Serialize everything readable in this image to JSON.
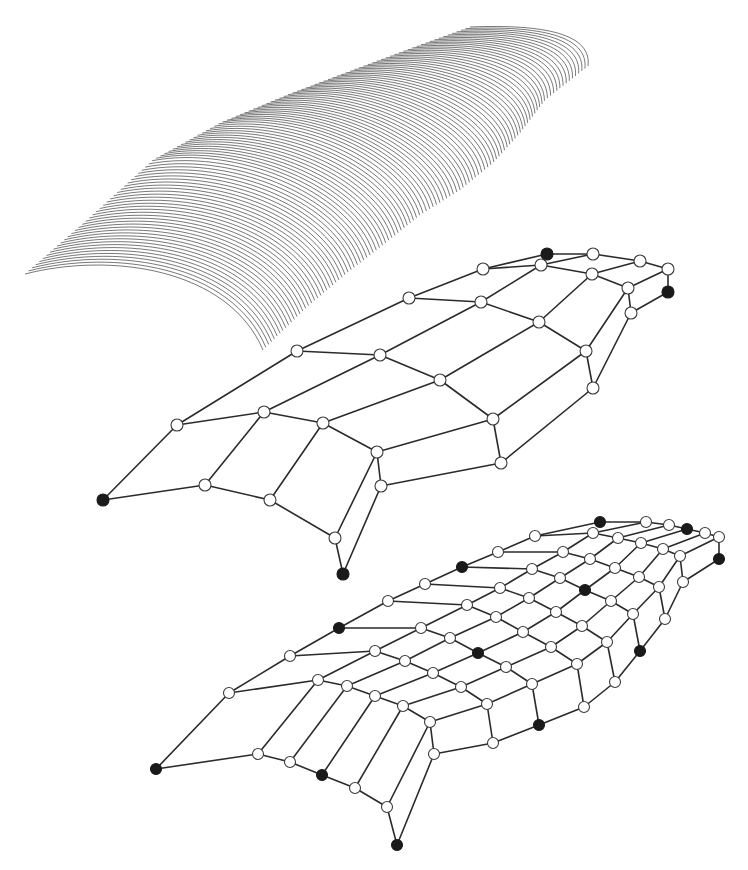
{
  "figure": {
    "width": 748,
    "height": 870,
    "colors": {
      "background": "#ffffff",
      "curve": "#2a2a2a",
      "edge": "#2b2b2b",
      "open_node_fill": "#ffffff",
      "filled_node_fill": "#1a1a1a"
    }
  },
  "ruled_surface": {
    "curve_count": 110,
    "first_curve": [
      [
        25,
        274
      ],
      [
        110,
        252
      ],
      [
        228,
        268
      ],
      [
        263,
        350
      ]
    ],
    "last_curve": [
      [
        470,
        27
      ],
      [
        545,
        24
      ],
      [
        592,
        34
      ],
      [
        588,
        66
      ]
    ],
    "start_edge": [
      [
        25,
        274
      ],
      [
        87,
        220
      ],
      [
        153,
        160
      ],
      [
        220,
        123
      ],
      [
        287,
        95
      ],
      [
        353,
        70
      ],
      [
        420,
        45
      ],
      [
        470,
        27
      ]
    ],
    "end_edge": [
      [
        263,
        350
      ],
      [
        307,
        307
      ],
      [
        347,
        273
      ],
      [
        383,
        245
      ],
      [
        420,
        215
      ],
      [
        460,
        190
      ],
      [
        493,
        163
      ],
      [
        520,
        133
      ],
      [
        545,
        100
      ],
      [
        588,
        66
      ]
    ]
  },
  "coarse_mesh": {
    "rows": 5,
    "cols": 6,
    "node_radius": 6,
    "nodes": [
      [
        [
          103,
          500
        ],
        [
          177,
          425
        ],
        [
          297,
          351
        ],
        [
          409,
          298
        ],
        [
          483,
          269
        ],
        [
          547,
          254
        ]
      ],
      [
        [
          205,
          485
        ],
        [
          264,
          412
        ],
        [
          380,
          355
        ],
        [
          481,
          302
        ],
        [
          541,
          265
        ],
        [
          593,
          254
        ]
      ],
      [
        [
          270,
          500
        ],
        [
          323,
          423
        ],
        [
          440,
          380
        ],
        [
          539,
          322
        ],
        [
          592,
          274
        ],
        [
          640,
          261
        ]
      ],
      [
        [
          335,
          538
        ],
        [
          377,
          452
        ],
        [
          493,
          419
        ],
        [
          586,
          351
        ],
        [
          628,
          288
        ],
        [
          668,
          269
        ]
      ],
      [
        [
          343,
          574
        ],
        [
          381,
          486
        ],
        [
          501,
          463
        ],
        [
          593,
          388
        ],
        [
          631,
          313
        ],
        [
          668,
          292
        ]
      ]
    ],
    "filled": [
      [
        0,
        0
      ],
      [
        0,
        5
      ],
      [
        4,
        0
      ],
      [
        4,
        5
      ]
    ]
  },
  "fine_mesh": {
    "rows": 7,
    "cols": 10,
    "node_radius": 5.5,
    "nodes": [
      [
        [
          156,
          769
        ],
        [
          229,
          693
        ],
        [
          290,
          656
        ],
        [
          339,
          628
        ],
        [
          388,
          601
        ],
        [
          425,
          584
        ],
        [
          462,
          567
        ],
        [
          498,
          552
        ],
        [
          535,
          536
        ],
        [
          600,
          522
        ]
      ],
      [
        [
          258,
          754
        ],
        [
          318,
          680
        ],
        [
          375,
          651
        ],
        [
          421,
          628
        ],
        [
          467,
          605
        ],
        [
          500,
          588
        ],
        [
          532,
          569
        ],
        [
          563,
          552
        ],
        [
          593,
          533
        ],
        [
          646,
          522
        ]
      ],
      [
        [
          290,
          762
        ],
        [
          347,
          686
        ],
        [
          405,
          661
        ],
        [
          450,
          638
        ],
        [
          496,
          617
        ],
        [
          529,
          598
        ],
        [
          560,
          578
        ],
        [
          590,
          559
        ],
        [
          618,
          538
        ],
        [
          669,
          525
        ]
      ],
      [
        [
          322,
          775
        ],
        [
          375,
          696
        ],
        [
          433,
          673
        ],
        [
          478,
          653
        ],
        [
          523,
          632
        ],
        [
          556,
          612
        ],
        [
          585,
          590
        ],
        [
          615,
          568
        ],
        [
          641,
          543
        ],
        [
          687,
          529
        ]
      ],
      [
        [
          355,
          788
        ],
        [
          403,
          706
        ],
        [
          461,
          687
        ],
        [
          506,
          667
        ],
        [
          551,
          647
        ],
        [
          582,
          626
        ],
        [
          611,
          601
        ],
        [
          639,
          577
        ],
        [
          663,
          549
        ],
        [
          705,
          533
        ]
      ],
      [
        [
          387,
          807
        ],
        [
          430,
          722
        ],
        [
          487,
          704
        ],
        [
          532,
          684
        ],
        [
          577,
          664
        ],
        [
          607,
          642
        ],
        [
          633,
          614
        ],
        [
          659,
          587
        ],
        [
          680,
          556
        ],
        [
          719,
          537
        ]
      ],
      [
        [
          397,
          845
        ],
        [
          434,
          754
        ],
        [
          493,
          743
        ],
        [
          539,
          725
        ],
        [
          584,
          707
        ],
        [
          615,
          682
        ],
        [
          640,
          651
        ],
        [
          665,
          619
        ],
        [
          683,
          582
        ],
        [
          719,
          559
        ]
      ]
    ],
    "filled": [
      [
        0,
        0
      ],
      [
        0,
        3
      ],
      [
        0,
        6
      ],
      [
        0,
        9
      ],
      [
        3,
        0
      ],
      [
        3,
        3
      ],
      [
        3,
        6
      ],
      [
        3,
        9
      ],
      [
        6,
        0
      ],
      [
        6,
        3
      ],
      [
        6,
        6
      ],
      [
        6,
        9
      ]
    ]
  }
}
